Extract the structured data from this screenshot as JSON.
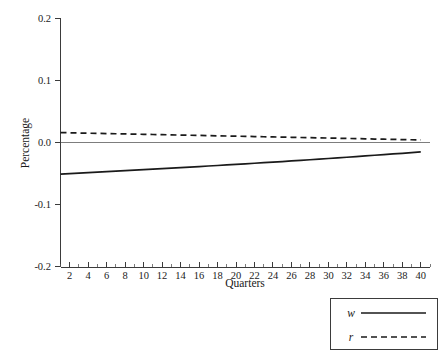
{
  "chart_data": {
    "type": "line",
    "title": "",
    "xlabel": "Quarters",
    "ylabel": "Percentage",
    "xlim": [
      1,
      41
    ],
    "ylim": [
      -0.2,
      0.2
    ],
    "grid": false,
    "legend_position": "bottom-right",
    "yticks": [
      "0.2",
      "0.1",
      "0.0",
      "-0.1",
      "-0.2"
    ],
    "ytick_values": [
      0.2,
      0.1,
      0.0,
      -0.1,
      -0.2
    ],
    "xticks": [
      "2",
      "4",
      "6",
      "8",
      "10",
      "12",
      "14",
      "16",
      "18",
      "20",
      "22",
      "24",
      "26",
      "28",
      "30",
      "32",
      "34",
      "36",
      "38",
      "40"
    ],
    "xtick_values": [
      2,
      4,
      6,
      8,
      10,
      12,
      14,
      16,
      18,
      20,
      22,
      24,
      26,
      28,
      30,
      32,
      34,
      36,
      38,
      40
    ],
    "xminor_values": [
      1,
      3,
      5,
      7,
      9,
      11,
      13,
      15,
      17,
      19,
      21,
      23,
      25,
      27,
      29,
      31,
      33,
      35,
      37,
      39,
      41
    ],
    "zero_reference_line": 0.0,
    "x": [
      1,
      2,
      3,
      4,
      5,
      6,
      7,
      8,
      9,
      10,
      11,
      12,
      13,
      14,
      15,
      16,
      17,
      18,
      19,
      20,
      21,
      22,
      23,
      24,
      25,
      26,
      27,
      28,
      29,
      30,
      31,
      32,
      33,
      34,
      35,
      36,
      37,
      38,
      39,
      40
    ],
    "series": [
      {
        "name": "w",
        "style": "solid",
        "color": "#1a1a1a",
        "values": [
          -0.051,
          -0.0502,
          -0.0494,
          -0.0486,
          -0.0478,
          -0.047,
          -0.0462,
          -0.0454,
          -0.0446,
          -0.0438,
          -0.043,
          -0.0421,
          -0.0413,
          -0.0405,
          -0.0396,
          -0.0388,
          -0.0379,
          -0.0371,
          -0.0362,
          -0.0353,
          -0.0344,
          -0.0335,
          -0.0326,
          -0.0316,
          -0.0307,
          -0.0297,
          -0.0288,
          -0.0278,
          -0.0268,
          -0.0258,
          -0.0248,
          -0.0238,
          -0.0227,
          -0.0217,
          -0.0206,
          -0.0196,
          -0.0185,
          -0.0174,
          -0.0163,
          -0.0152
        ]
      },
      {
        "name": "r",
        "style": "dashed",
        "color": "#1a1a1a",
        "values": [
          0.016,
          0.0157,
          0.0153,
          0.015,
          0.0147,
          0.0144,
          0.0141,
          0.0138,
          0.0135,
          0.0132,
          0.0129,
          0.0126,
          0.0123,
          0.012,
          0.0117,
          0.0114,
          0.0111,
          0.0108,
          0.0105,
          0.0102,
          0.0099,
          0.0096,
          0.0093,
          0.009,
          0.0087,
          0.0084,
          0.0081,
          0.0078,
          0.0075,
          0.0072,
          0.0069,
          0.0066,
          0.0063,
          0.006,
          0.0056,
          0.0053,
          0.005,
          0.0047,
          0.0044,
          0.0041
        ]
      }
    ]
  },
  "legend": {
    "entries": [
      {
        "label": "w",
        "style": "solid"
      },
      {
        "label": "r",
        "style": "dashed"
      }
    ]
  }
}
